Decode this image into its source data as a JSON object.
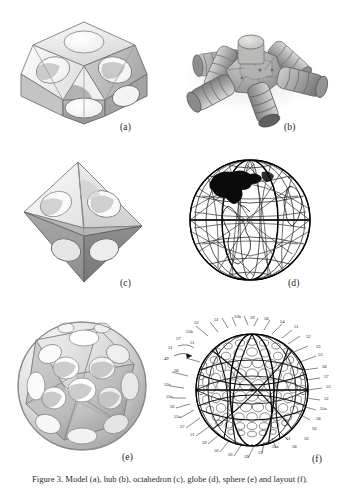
{
  "figure": {
    "caption_prefix": "Figure 3.",
    "caption_text": "Figure 3. Model (a), hub (b), octahedron (c), globe (d), sphere (e) and layout (f).",
    "panel_count": 6
  },
  "panels": [
    {
      "id": "a",
      "label": "(a)",
      "name": "cuboctahedral-shell-model",
      "description": "Cube-like polyhedral shell with circular apertures on each face",
      "style": "greyscale rendered solid"
    },
    {
      "id": "b",
      "label": "(b)",
      "name": "six-arm-hub-connector",
      "description": "Central hub with six ribbed cylindrical arms",
      "arm_count": 6,
      "style": "greyscale photographic render with drop shadow"
    },
    {
      "id": "c",
      "label": "(c)",
      "name": "octahedral-shell-model",
      "description": "Octahedron shell with circular apertures on triangular faces",
      "style": "greyscale rendered solid"
    },
    {
      "id": "d",
      "label": "(d)",
      "name": "geodesic-globe-map",
      "description": "Earth globe with latitude, longitude and geodesic triangular grid overlay",
      "style": "line drawing with filled landmass"
    },
    {
      "id": "e",
      "label": "(e)",
      "name": "polyhedral-sphere-shell",
      "description": "Near-spherical polyhedral shell with many circular apertures",
      "style": "greyscale rendered solid"
    },
    {
      "id": "f",
      "label": "(f)",
      "name": "geodesic-sphere-patent-diagram",
      "description": "Patent style line drawing of a geodesic sphere of packed circles with numbered reference leaders",
      "style": "black and white line art"
    }
  ],
  "reference_numerals": {
    "assembly_pointer": "49",
    "top_left": [
      "53",
      "52",
      "55b",
      "59",
      "55b",
      "57",
      "51"
    ],
    "top_center": [
      "55b",
      "59",
      "50",
      "54",
      "51",
      "52",
      "53"
    ],
    "right": [
      "53",
      "52",
      "53",
      "50",
      "57",
      "53",
      "52",
      "55a",
      "58"
    ],
    "lower_right": [
      "55a",
      "58",
      "56",
      "56",
      "50",
      "51"
    ],
    "left": [
      "51",
      "49",
      "50",
      "53a",
      "53a",
      "56",
      "55a",
      "57",
      "51"
    ],
    "bottom": [
      "59",
      "56",
      "56",
      "59",
      "57",
      "55a",
      "51"
    ],
    "unique_values": [
      "49",
      "50",
      "51",
      "52",
      "53",
      "53a",
      "54",
      "55a",
      "55b",
      "56",
      "57",
      "58",
      "59"
    ]
  },
  "colors": {
    "background": "#ffffff",
    "ink": "#1a1a1a",
    "line_art": "#000000",
    "shell_light": "#f2f2f2",
    "shell_mid": "#c9c9c9",
    "shell_dark": "#9a9a9a",
    "shell_shadow": "#7d7d7d",
    "hub_metal": "#9d9d9d",
    "hub_highlight": "#d8d8d8",
    "soft_shadow": "#e9ecee"
  }
}
